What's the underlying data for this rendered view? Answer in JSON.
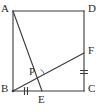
{
  "figure": {
    "type": "geometry-diagram",
    "canvas": {
      "width": 104,
      "height": 112
    },
    "colors": {
      "background": "#ffffff",
      "stroke": "#3a3a3a",
      "label": "#2b2b2b"
    },
    "stroke_width": 1.1,
    "points": [
      {
        "id": "A",
        "label": "A",
        "x": 13,
        "y": 11,
        "label_x": 1,
        "label_y": 3,
        "corner": true
      },
      {
        "id": "D",
        "label": "D",
        "x": 84,
        "y": 11,
        "label_x": 88,
        "label_y": 3,
        "corner": true
      },
      {
        "id": "B",
        "label": "B",
        "x": 13,
        "y": 91,
        "label_x": 1,
        "label_y": 83,
        "corner": true
      },
      {
        "id": "C",
        "label": "C",
        "x": 84,
        "y": 91,
        "label_x": 88,
        "label_y": 83,
        "corner": true
      },
      {
        "id": "F",
        "label": "F",
        "x": 84,
        "y": 53,
        "label_x": 88,
        "label_y": 45,
        "corner": false
      },
      {
        "id": "E",
        "label": "E",
        "x": 42,
        "y": 91,
        "label_x": 38,
        "label_y": 93,
        "corner": false
      },
      {
        "id": "P",
        "label": "P",
        "x": 38,
        "y": 76,
        "label_x": 29,
        "label_y": 66,
        "corner": false
      }
    ],
    "segments": [
      {
        "id": "AD",
        "from": "A",
        "to": "D",
        "kind": "square-side"
      },
      {
        "id": "DC",
        "from": "D",
        "to": "C",
        "kind": "square-side"
      },
      {
        "id": "CB",
        "from": "C",
        "to": "B",
        "kind": "square-side"
      },
      {
        "id": "BA",
        "from": "B",
        "to": "A",
        "kind": "square-side"
      },
      {
        "id": "AE",
        "from": "A",
        "to": "E",
        "kind": "cevian"
      },
      {
        "id": "BF",
        "from": "B",
        "to": "F",
        "kind": "cevian"
      }
    ],
    "tick_marks": [
      {
        "id": "BE-ticks",
        "on_segment": "BE",
        "count": 2,
        "orientation": "vertical",
        "x": 26,
        "y": 91
      },
      {
        "id": "FC-ticks",
        "on_segment": "FC",
        "count": 2,
        "orientation": "horizontal",
        "x": 84,
        "y": 72
      }
    ],
    "angle_markers": [
      {
        "id": "angle-at-P",
        "at_point": "P",
        "x": 38,
        "y": 76,
        "radius": 7,
        "style": "arc"
      }
    ]
  }
}
